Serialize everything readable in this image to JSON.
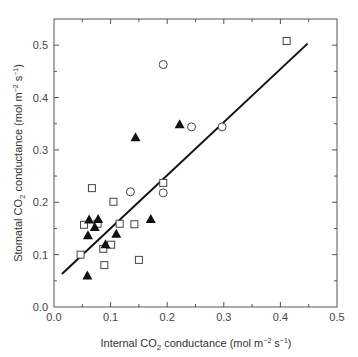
{
  "chart_data": {
    "type": "scatter",
    "title": "",
    "xlabel": "Internal CO2 conductance (mol m-2 s-1)",
    "ylabel": "Stomatal CO2 conductance (mol m-2 s-1)",
    "xlabel_parts": {
      "pre": "Internal CO",
      "sub": "2",
      "mid": " conductance (mol m",
      "sup1": "−2",
      "mid2": " s",
      "sup2": "−1",
      "post": ")"
    },
    "ylabel_parts": {
      "pre": "Stomatal CO",
      "sub": "2",
      "mid": " conductance (mol m",
      "sup1": "−2",
      "mid2": " s",
      "sup2": "−1",
      "post": ")"
    },
    "xlim": [
      0,
      0.5
    ],
    "ylim": [
      0,
      0.55
    ],
    "x_ticks": [
      "0.0",
      "0.1",
      "0.2",
      "0.3",
      "0.4",
      "0.5"
    ],
    "y_ticks": [
      "0.0",
      "0.1",
      "0.2",
      "0.3",
      "0.4",
      "0.5"
    ],
    "grid": false,
    "legend": null,
    "series": [
      {
        "name": "open squares",
        "marker": "square-open",
        "points": [
          [
            0.411,
            0.508
          ],
          [
            0.193,
            0.237
          ],
          [
            0.067,
            0.227
          ],
          [
            0.105,
            0.201
          ],
          [
            0.053,
            0.157
          ],
          [
            0.077,
            0.159
          ],
          [
            0.116,
            0.159
          ],
          [
            0.142,
            0.158
          ],
          [
            0.101,
            0.119
          ],
          [
            0.087,
            0.111
          ],
          [
            0.047,
            0.1
          ],
          [
            0.089,
            0.08
          ],
          [
            0.15,
            0.09
          ]
        ]
      },
      {
        "name": "open circles",
        "marker": "circle-open",
        "points": [
          [
            0.193,
            0.463
          ],
          [
            0.243,
            0.344
          ],
          [
            0.297,
            0.344
          ],
          [
            0.135,
            0.22
          ],
          [
            0.193,
            0.218
          ]
        ]
      },
      {
        "name": "filled triangles",
        "marker": "triangle-filled",
        "points": [
          [
            0.222,
            0.349
          ],
          [
            0.144,
            0.324
          ],
          [
            0.171,
            0.168
          ],
          [
            0.062,
            0.167
          ],
          [
            0.078,
            0.168
          ],
          [
            0.072,
            0.153
          ],
          [
            0.06,
            0.137
          ],
          [
            0.11,
            0.14
          ],
          [
            0.091,
            0.12
          ],
          [
            0.059,
            0.06
          ]
        ]
      }
    ],
    "regression_line": {
      "x1": 0.014,
      "y1": 0.063,
      "x2": 0.448,
      "y2": 0.503
    }
  }
}
